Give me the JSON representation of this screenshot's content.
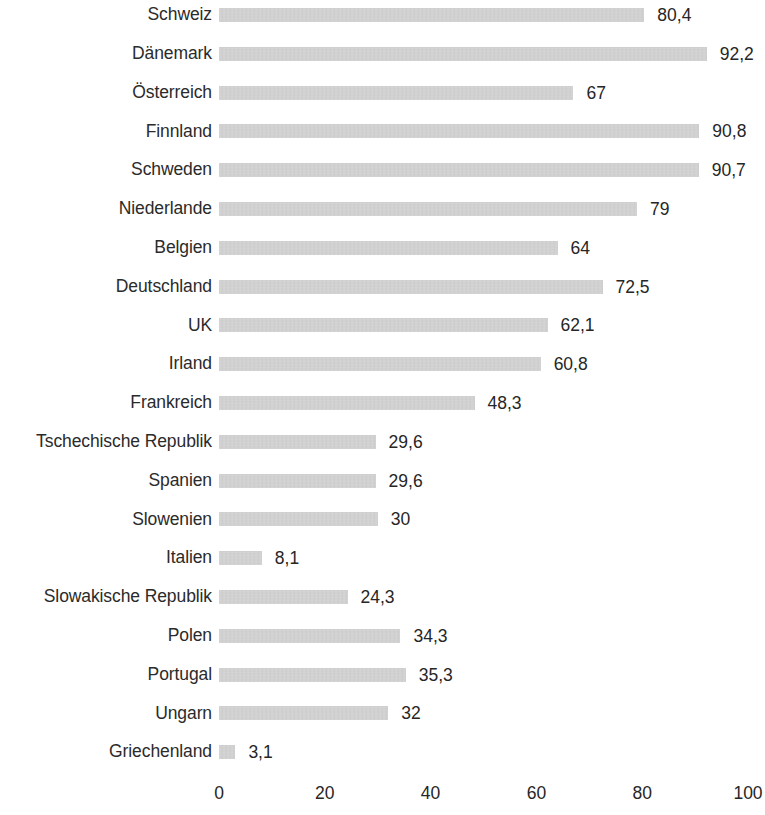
{
  "chart_data": {
    "type": "bar",
    "orientation": "horizontal",
    "title": "",
    "subtitle": "",
    "xlabel": "",
    "ylabel": "",
    "xlim": [
      0,
      100
    ],
    "grid": false,
    "legend": null,
    "decimal_separator": ",",
    "bar_color": "#c8c8c8",
    "text_color": "#262626",
    "background": "#ffffff",
    "xticks": [
      0,
      20,
      40,
      60,
      80,
      100
    ],
    "xtick_labels": [
      "0",
      "20",
      "40",
      "60",
      "80",
      "100"
    ],
    "categories": [
      "Schweiz",
      "Dänemark",
      "Österreich",
      "Finnland",
      "Schweden",
      "Niederlande",
      "Belgien",
      "Deutschland",
      "UK",
      "Irland",
      "Frankreich",
      "Tschechische Republik",
      "Spanien",
      "Slowenien",
      "Italien",
      "Slowakische Republik",
      "Polen",
      "Portugal",
      "Ungarn",
      "Griechenland"
    ],
    "values": [
      80.4,
      92.2,
      67,
      90.8,
      90.7,
      79,
      64,
      72.5,
      62.1,
      60.8,
      48.3,
      29.6,
      29.6,
      30,
      8.1,
      24.3,
      34.3,
      35.3,
      32,
      3.1
    ],
    "value_labels": [
      "80,4",
      "92,2",
      "67",
      "90,8",
      "90,7",
      "79",
      "64",
      "72,5",
      "62,1",
      "60,8",
      "48,3",
      "29,6",
      "29,6",
      "30",
      "8,1",
      "24,3",
      "34,3",
      "35,3",
      "32",
      "3,1"
    ]
  }
}
